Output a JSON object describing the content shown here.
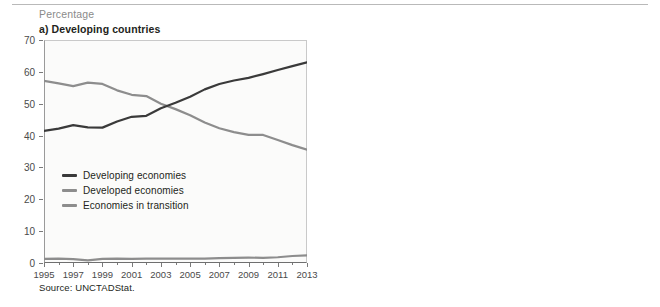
{
  "figure": {
    "unit_label": "Percentage",
    "source_text": "Source:  UNCTADStat."
  },
  "colors": {
    "developing": "#3a3a3a",
    "developed": "#8d8d8d",
    "transition": "#8d8d8d",
    "axis": "#6f6f6f",
    "plot_background": "#fbfbfa",
    "text": "#231f20",
    "muted_text": "#8a8a8a"
  },
  "legend": {
    "items": [
      {
        "label": "Developing economies",
        "color_key": "developing"
      },
      {
        "label": "Developed economies",
        "color_key": "developed"
      },
      {
        "label": "Economies in transition",
        "color_key": "transition"
      }
    ]
  },
  "panels": [
    {
      "id": "a",
      "title": "a) Developing countries",
      "y_ticks": [
        0,
        10,
        20,
        30,
        40,
        50,
        60,
        70
      ],
      "ylim": [
        0,
        70
      ],
      "x_ticks": [
        "1995",
        "1997",
        "1999",
        "2001",
        "2003",
        "2005",
        "2007",
        "2009",
        "2011",
        "2013"
      ],
      "xlim": [
        1995,
        2013
      ]
    },
    {
      "id": "b",
      "title": "b) Developed countries",
      "y_ticks": [
        0,
        10,
        20,
        30,
        40,
        50,
        60,
        70,
        80
      ],
      "ylim": [
        0,
        80
      ],
      "x_ticks": [
        "1995",
        "1997",
        "1999",
        "2001",
        "2003",
        "2005",
        "2007",
        "2009",
        "2011",
        "2013"
      ],
      "xlim": [
        1995,
        2013
      ]
    }
  ],
  "chart_data": [
    {
      "type": "line",
      "title": "a) Developing countries",
      "xlabel": "",
      "ylabel": "Percentage",
      "ylim": [
        0,
        70
      ],
      "grid": false,
      "legend_position": "inside-lower-left",
      "x": [
        1995,
        1996,
        1997,
        1998,
        1999,
        2000,
        2001,
        2002,
        2003,
        2004,
        2005,
        2006,
        2007,
        2008,
        2009,
        2010,
        2011,
        2012,
        2013
      ],
      "series": [
        {
          "name": "Developing economies",
          "color": "#3a3a3a",
          "values": [
            41.5,
            42.2,
            43.3,
            42.6,
            42.5,
            44.4,
            45.9,
            46.2,
            48.6,
            50.3,
            52.2,
            54.5,
            56.2,
            57.3,
            58.1,
            59.3,
            60.6,
            61.8,
            63.0
          ]
        },
        {
          "name": "Developed economies",
          "color": "#8d8d8d",
          "values": [
            57.2,
            56.4,
            55.5,
            56.6,
            56.2,
            54.2,
            52.8,
            52.4,
            50.0,
            48.3,
            46.4,
            44.1,
            42.3,
            41.1,
            40.2,
            40.2,
            38.6,
            37.0,
            35.6
          ]
        },
        {
          "name": "Economies in transition",
          "color": "#8d8d8d",
          "values": [
            1.3,
            1.4,
            1.2,
            0.8,
            1.3,
            1.4,
            1.3,
            1.4,
            1.4,
            1.4,
            1.4,
            1.4,
            1.5,
            1.6,
            1.7,
            1.6,
            1.8,
            2.2,
            2.4
          ]
        }
      ]
    },
    {
      "type": "line",
      "title": "b) Developed countries",
      "xlabel": "",
      "ylabel": "Percentage",
      "ylim": [
        0,
        80
      ],
      "grid": false,
      "legend_position": "inside-middle-left",
      "x": [
        1995,
        1996,
        1997,
        1998,
        1999,
        2000,
        2001,
        2002,
        2003,
        2004,
        2005,
        2006,
        2007,
        2008,
        2009,
        2010,
        2011,
        2012,
        2013
      ],
      "series": [
        {
          "name": "Developing economies",
          "color": "#3a3a3a",
          "values": [
            23.0,
            23.6,
            24.3,
            22.9,
            24.3,
            27.0,
            25.9,
            25.9,
            26.3,
            27.5,
            28.5,
            29.5,
            29.0,
            29.3,
            29.8,
            31.3,
            32.3,
            33.6,
            33.0
          ]
        },
        {
          "name": "Developed economies",
          "color": "#8d8d8d",
          "values": [
            75.4,
            74.9,
            73.9,
            75.7,
            74.2,
            71.3,
            72.5,
            72.4,
            71.8,
            70.6,
            68.5,
            67.5,
            68.2,
            66.3,
            67.3,
            65.1,
            63.8,
            62.7,
            63.5
          ]
        },
        {
          "name": "Economies in transition",
          "color": "#8d8d8d",
          "values": [
            1.6,
            1.6,
            1.7,
            1.7,
            1.9,
            2.1,
            2.2,
            2.4,
            2.6,
            2.9,
            3.3,
            3.7,
            3.4,
            4.7,
            3.8,
            4.0,
            4.2,
            4.5,
            4.5
          ]
        }
      ]
    }
  ]
}
